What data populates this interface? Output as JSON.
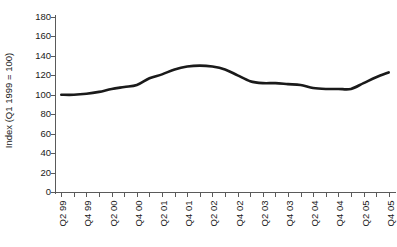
{
  "chart_data": {
    "type": "line",
    "title": "",
    "xlabel": "",
    "ylabel": "Index (Q1 1999 = 100)",
    "ylim": [
      0,
      180
    ],
    "ytick_values": [
      0,
      20,
      40,
      60,
      80,
      100,
      120,
      140,
      160,
      180
    ],
    "ytick_labels": [
      "0",
      "20",
      "40",
      "60",
      "80",
      "100",
      "120",
      "140",
      "160",
      "180"
    ],
    "grid": false,
    "legend": null,
    "line_color": "#1a1a1a",
    "axis_color": "#5a5a5a",
    "categories": [
      "Q2 99",
      "Q3 99",
      "Q4 99",
      "Q1 00",
      "Q2 00",
      "Q3 00",
      "Q4 00",
      "Q1 01",
      "Q2 01",
      "Q3 01",
      "Q4 01",
      "Q1 02",
      "Q2 02",
      "Q3 02",
      "Q4 02",
      "Q1 03",
      "Q2 03",
      "Q3 03",
      "Q4 03",
      "Q1 04",
      "Q2 04",
      "Q3 04",
      "Q4 04",
      "Q1 05",
      "Q2 05",
      "Q3 05",
      "Q4 05"
    ],
    "xtick_labels_shown": [
      "Q2 99",
      "",
      "Q4 99",
      "",
      "Q2 00",
      "",
      "Q4 00",
      "",
      "Q2 01",
      "",
      "Q4 01",
      "",
      "Q2 02",
      "",
      "Q4 02",
      "",
      "Q2 03",
      "",
      "Q4 03",
      "",
      "Q2 04",
      "",
      "Q4 04",
      "",
      "Q2 05",
      "",
      "Q4 05"
    ],
    "values": [
      100,
      100,
      101,
      103,
      106,
      109,
      110,
      117,
      121,
      126,
      129,
      130,
      129,
      126,
      120,
      114,
      112,
      112,
      111,
      110,
      107,
      106,
      106,
      106,
      112,
      118,
      123
    ],
    "values_tail": [
      129,
      135,
      140,
      148,
      155,
      160,
      162
    ],
    "series": [
      {
        "name": "Index",
        "points": [
          {
            "x": "Q2 99",
            "y": 100
          },
          {
            "x": "Q3 99",
            "y": 100
          },
          {
            "x": "Q4 99",
            "y": 101
          },
          {
            "x": "Q1 00",
            "y": 103
          },
          {
            "x": "Q2 00",
            "y": 106
          },
          {
            "x": "Q3 00",
            "y": 108
          },
          {
            "x": "Q4 00",
            "y": 110
          },
          {
            "x": "Q1 01",
            "y": 117
          },
          {
            "x": "Q2 01",
            "y": 121
          },
          {
            "x": "Q3 01",
            "y": 126
          },
          {
            "x": "Q4 01",
            "y": 129
          },
          {
            "x": "Q1 02",
            "y": 130
          },
          {
            "x": "Q2 02",
            "y": 129
          },
          {
            "x": "Q3 02",
            "y": 126
          },
          {
            "x": "Q4 02",
            "y": 120
          },
          {
            "x": "Q1 03",
            "y": 114
          },
          {
            "x": "Q2 03",
            "y": 112
          },
          {
            "x": "Q3 03",
            "y": 112
          },
          {
            "x": "Q4 03",
            "y": 111
          },
          {
            "x": "Q1 04",
            "y": 110
          },
          {
            "x": "Q2 04",
            "y": 107
          },
          {
            "x": "Q3 04",
            "y": 106
          },
          {
            "x": "Q4 04",
            "y": 106
          },
          {
            "x": "Q1 05",
            "y": 106
          },
          {
            "x": "Q2 05",
            "y": 112
          },
          {
            "x": "Q3 05",
            "y": 118
          },
          {
            "x": "Q4 05",
            "y": 123
          }
        ]
      }
    ]
  }
}
